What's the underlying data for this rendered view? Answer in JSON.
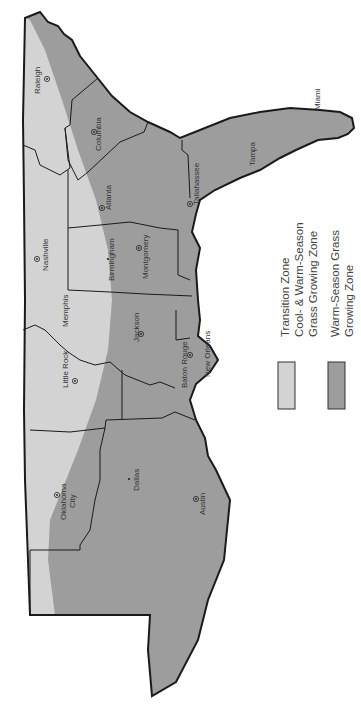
{
  "map": {
    "orientation": "rotated-90-clockwise",
    "colors": {
      "transition_zone": "#d3d3d3",
      "warm_season_zone": "#9d9d9d",
      "border": "#1a1a1a",
      "water": "#ffffff"
    },
    "cities": [
      {
        "name": "Raleigh",
        "marker": "dot-circle"
      },
      {
        "name": "Columbia",
        "marker": "dot-circle"
      },
      {
        "name": "Atlanta",
        "marker": "dot-circle"
      },
      {
        "name": "Tallahassee",
        "marker": "dot-circle"
      },
      {
        "name": "Tampa",
        "marker": "none"
      },
      {
        "name": "Miami",
        "marker": "none"
      },
      {
        "name": "Nashville",
        "marker": "dot-circle"
      },
      {
        "name": "Birmingham",
        "marker": "dot"
      },
      {
        "name": "Montgomery",
        "marker": "dot-circle"
      },
      {
        "name": "Memphis",
        "marker": "none"
      },
      {
        "name": "Jackson",
        "marker": "dot-circle"
      },
      {
        "name": "Baton Rouge",
        "marker": "dot-circle"
      },
      {
        "name": "New Orleans",
        "marker": "none"
      },
      {
        "name": "Little Rock",
        "marker": "dot-circle"
      },
      {
        "name": "Oklahoma",
        "marker": "dot-circle"
      },
      {
        "name": "City",
        "marker": "none"
      },
      {
        "name": "Dallas",
        "marker": "dot"
      },
      {
        "name": "Austin",
        "marker": "dot-circle"
      }
    ]
  },
  "legend": {
    "items": [
      {
        "swatch_color": "#d3d3d3",
        "line1": "Transition Zone",
        "line2": "Cool- & Warm-Season",
        "line3": "Grass Growing Zone"
      },
      {
        "swatch_color": "#9d9d9d",
        "line1": "Warm-Season Grass",
        "line2": "Growing Zone"
      }
    ]
  }
}
